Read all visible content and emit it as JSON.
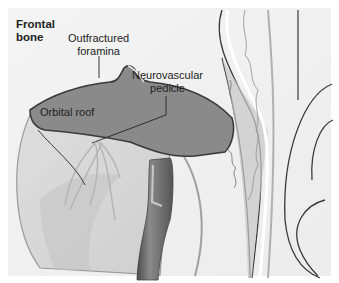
{
  "figure": {
    "labels": {
      "frontal_bone_line1": "Frontal",
      "frontal_bone_line2": "bone",
      "outfractured_line1": "Outfractured",
      "outfractured_line2": "foramina",
      "neurovascular_line1": "Neurovascular",
      "neurovascular_line2": "pedicle",
      "orbital_roof": "Orbital roof"
    },
    "colors": {
      "background": "#f2f2f2",
      "orbital_roof_fill": "#8a8a8a",
      "outline": "#3a3a3a",
      "globe_fill": "#d8d8d8",
      "retractor": "#6a6a6a"
    }
  }
}
